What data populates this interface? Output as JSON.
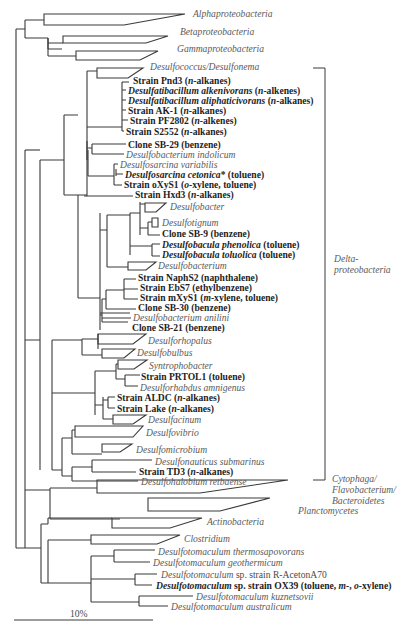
{
  "figure": {
    "type": "phylogenetic-tree",
    "scale_bar": {
      "label": "10%"
    },
    "group_brackets": [
      {
        "label_lines": [
          "Delta-",
          "proteobacteria"
        ]
      }
    ]
  },
  "labels": [
    {
      "text": "Alphaproteobacteria",
      "style": "it",
      "x": 193,
      "y": 13
    },
    {
      "text": "Betaproteobacteria",
      "style": "it",
      "x": 180,
      "y": 31
    },
    {
      "text": "Gammaproteobacteria",
      "style": "it",
      "x": 177,
      "y": 48
    },
    {
      "text": "Desulfococcus/Desulfonema",
      "style": "it",
      "x": 150,
      "y": 66
    },
    {
      "parts": [
        [
          "Strain Pnd3 (",
          "b"
        ],
        [
          "n",
          "bi"
        ],
        [
          "-alkanes)",
          "b"
        ]
      ],
      "x": 133,
      "y": 80
    },
    {
      "parts": [
        [
          "Desulfatibacillum alkenivorans",
          "bi"
        ],
        [
          " (",
          "b"
        ],
        [
          "n",
          "bi"
        ],
        [
          "-alkenes)",
          "b"
        ]
      ],
      "x": 128,
      "y": 90
    },
    {
      "parts": [
        [
          "Desulfatibacillum aliphaticivorans",
          "bi"
        ],
        [
          " (",
          "b"
        ],
        [
          "n",
          "bi"
        ],
        [
          "-alkanes)",
          "b"
        ]
      ],
      "x": 128,
      "y": 100
    },
    {
      "parts": [
        [
          "Strain AK-1 (",
          "b"
        ],
        [
          "n",
          "bi"
        ],
        [
          "-alkanes)",
          "b"
        ]
      ],
      "x": 128,
      "y": 110
    },
    {
      "parts": [
        [
          "Strain PF2802 (",
          "b"
        ],
        [
          "n",
          "bi"
        ],
        [
          "-alkenes)",
          "b"
        ]
      ],
      "x": 130,
      "y": 120
    },
    {
      "parts": [
        [
          "Strain S2552 (",
          "b"
        ],
        [
          "n",
          "bi"
        ],
        [
          "-alkanes)",
          "b"
        ]
      ],
      "x": 126,
      "y": 131
    },
    {
      "parts": [
        [
          "Clone SB-29 (benzene)",
          "b"
        ]
      ],
      "x": 128,
      "y": 144
    },
    {
      "text": "Desulfobacterium indolicum",
      "style": "it",
      "x": 126,
      "y": 154
    },
    {
      "text": "Desulfosarcina variabilis",
      "style": "it",
      "x": 120,
      "y": 164
    },
    {
      "parts": [
        [
          "Desulfosarcina cetonica",
          "bi"
        ],
        [
          "* (toluene)",
          "b"
        ]
      ],
      "x": 125,
      "y": 174
    },
    {
      "parts": [
        [
          "Strain oXyS1 (",
          "b"
        ],
        [
          "o",
          "bi"
        ],
        [
          "-xylene, toluene)",
          "b"
        ]
      ],
      "x": 124,
      "y": 184
    },
    {
      "parts": [
        [
          "Strain Hxd3 (",
          "b"
        ],
        [
          "n",
          "bi"
        ],
        [
          "-alkanes)",
          "b"
        ]
      ],
      "x": 135,
      "y": 194
    },
    {
      "text": "Desulfobacter",
      "style": "it",
      "x": 170,
      "y": 206
    },
    {
      "text": "Desulfotignum",
      "style": "it",
      "x": 162,
      "y": 222
    },
    {
      "parts": [
        [
          "Clone SB-9 (benzene)",
          "b"
        ]
      ],
      "x": 162,
      "y": 233
    },
    {
      "parts": [
        [
          "Desulfobacula phenolica",
          "bi"
        ],
        [
          " (toluene)",
          "b"
        ]
      ],
      "x": 162,
      "y": 244
    },
    {
      "parts": [
        [
          "Desulfobacula toluolica",
          "bi"
        ],
        [
          " (toluene)",
          "b"
        ]
      ],
      "x": 162,
      "y": 254
    },
    {
      "text": "Desulfobacterium",
      "style": "it",
      "x": 158,
      "y": 265
    },
    {
      "parts": [
        [
          "Strain NaphS2 (naphthalene)",
          "b"
        ]
      ],
      "x": 138,
      "y": 277
    },
    {
      "parts": [
        [
          "Strain EbS7 (ethylbenzene)",
          "b"
        ]
      ],
      "x": 140,
      "y": 287
    },
    {
      "parts": [
        [
          "Strain mXyS1 (",
          "b"
        ],
        [
          "m",
          "bi"
        ],
        [
          "-xylene, toluene)",
          "b"
        ]
      ],
      "x": 140,
      "y": 297
    },
    {
      "parts": [
        [
          "Clone SB-30 (benzene)",
          "b"
        ]
      ],
      "x": 138,
      "y": 307
    },
    {
      "text": "Desulfobacterium anilini",
      "style": "it",
      "x": 133,
      "y": 317
    },
    {
      "parts": [
        [
          "Clone SB-21 (benzene)",
          "b"
        ]
      ],
      "x": 132,
      "y": 327
    },
    {
      "text": "Desulforhopalus",
      "style": "it",
      "x": 148,
      "y": 340
    },
    {
      "text": "Desulfobulbus",
      "style": "it",
      "x": 137,
      "y": 352
    },
    {
      "text": "Syntrophobacter",
      "style": "it",
      "x": 149,
      "y": 365
    },
    {
      "parts": [
        [
          "Strain PRTOL1 (toluene)",
          "b"
        ]
      ],
      "x": 141,
      "y": 376
    },
    {
      "text": "Desulforhabdus amnigenus",
      "style": "it",
      "x": 140,
      "y": 387
    },
    {
      "parts": [
        [
          "Strain ALDC (",
          "b"
        ],
        [
          "n",
          "bi"
        ],
        [
          "-alkanes)",
          "b"
        ]
      ],
      "x": 117,
      "y": 397
    },
    {
      "parts": [
        [
          "Strain Lake (",
          "b"
        ],
        [
          "n",
          "bi"
        ],
        [
          "-alkanes)",
          "b"
        ]
      ],
      "x": 117,
      "y": 408
    },
    {
      "text": "Desulfacinum",
      "style": "it",
      "x": 148,
      "y": 419
    },
    {
      "text": "Desulfovibrio",
      "style": "it",
      "x": 146,
      "y": 432
    },
    {
      "text": "Desulfomicrobium",
      "style": "it",
      "x": 136,
      "y": 449
    },
    {
      "text": "Desulfonauticus submarinus",
      "style": "it",
      "x": 155,
      "y": 461
    },
    {
      "parts": [
        [
          "Strain TD3 (",
          "b"
        ],
        [
          "n",
          "bi"
        ],
        [
          "-alkanes)",
          "b"
        ]
      ],
      "x": 139,
      "y": 471
    },
    {
      "text": "Desulfohalobium retbaense",
      "style": "it",
      "x": 141,
      "y": 481
    },
    {
      "text": "Cytophaga/",
      "style": "it",
      "x": 332,
      "y": 478
    },
    {
      "text": "Flavobacterium/",
      "style": "it",
      "x": 332,
      "y": 489
    },
    {
      "text": "Bacteroidetes",
      "style": "it",
      "x": 332,
      "y": 500
    },
    {
      "text": "Planctomycetes",
      "style": "it",
      "x": 298,
      "y": 510
    },
    {
      "text": "Actinobacteria",
      "style": "it",
      "x": 207,
      "y": 521
    },
    {
      "text": "Clostridium",
      "style": "it",
      "x": 184,
      "y": 538
    },
    {
      "text": "Desulfotomaculum thermosapovorans",
      "style": "it",
      "x": 158,
      "y": 551
    },
    {
      "text": "Desulfotomaculum geothermicum",
      "style": "it",
      "x": 153,
      "y": 562
    },
    {
      "parts": [
        [
          "Desulfotomaculum",
          "i"
        ],
        [
          "  sp. strain R-AcetonA70",
          "n"
        ]
      ],
      "x": 161,
      "y": 574
    },
    {
      "parts": [
        [
          "Desulfotomaculum",
          "bi"
        ],
        [
          " sp. strain OX39 (toluene, ",
          "b"
        ],
        [
          "m",
          "bi"
        ],
        [
          "-, ",
          "b"
        ],
        [
          "o",
          "bi"
        ],
        [
          "-xylene)",
          "b"
        ]
      ],
      "x": 156,
      "y": 585
    },
    {
      "text": "Desulfotomaculum kuznetsovii",
      "style": "it",
      "x": 196,
      "y": 596
    },
    {
      "text": "Desulfotomaculum australicum",
      "style": "it",
      "x": 171,
      "y": 606
    }
  ]
}
